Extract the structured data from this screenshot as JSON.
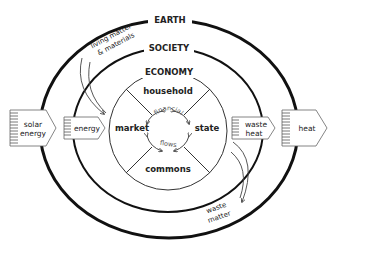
{
  "diagram": {
    "rings": {
      "earth": "EARTH",
      "society": "SOCIETY",
      "economy": "ECONOMY"
    },
    "sectors": {
      "top": "household",
      "left": "market",
      "right": "state",
      "bottom": "commons"
    },
    "inner_flows": {
      "top": "financial",
      "bottom": "flows"
    },
    "inputs": {
      "solar": [
        "solar",
        "energy"
      ],
      "energy": "energy",
      "materials": [
        "living matter",
        "& materials"
      ]
    },
    "outputs": {
      "waste_heat": [
        "waste",
        "heat"
      ],
      "heat": "heat",
      "waste_matter": [
        "waste",
        "matter"
      ]
    },
    "colors": {
      "line": "#1a1a1a",
      "text": "#222222",
      "muted": "#555555",
      "background": "#ffffff"
    }
  }
}
